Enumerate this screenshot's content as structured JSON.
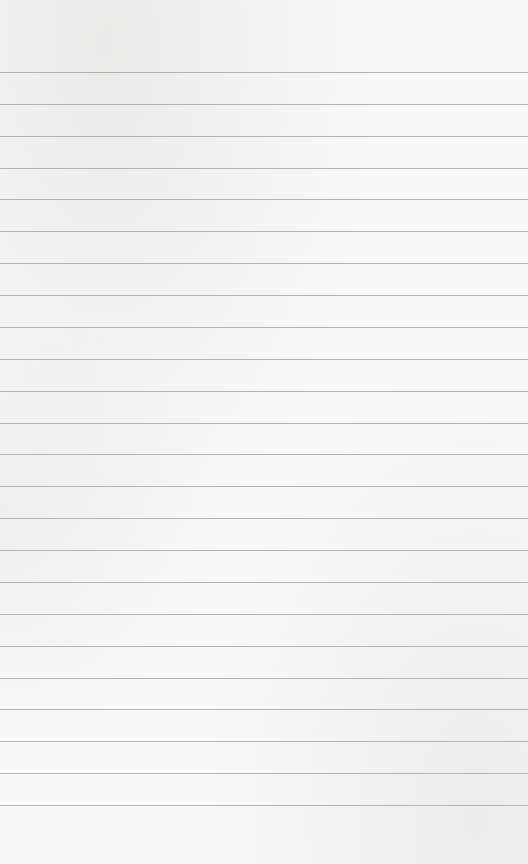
{
  "paper": {
    "type": "lined-paper",
    "background_color": "#f8f8f7",
    "line_color": "#9c9c9c",
    "line_count": 24,
    "first_line_y": 72,
    "line_spacing": 31.87
  }
}
